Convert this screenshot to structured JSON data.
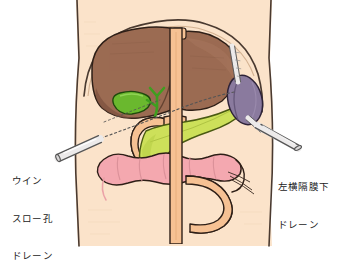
{
  "figure": {
    "background_color": "#ffffff",
    "body_fill": "#fbe3ca",
    "outline_color": "#3a2a22"
  },
  "labels": {
    "left_drain": {
      "name": "winslow-foramen-drain-label",
      "lines": [
        "ウイン",
        "スロー孔",
        "ドレーン"
      ],
      "line1": "ウイン",
      "line2": "スロー孔",
      "line3": "ドレーン",
      "color": "#1b1b1b"
    },
    "right_drain": {
      "name": "left-subphrenic-drain-label",
      "lines": [
        "左横隔膜下",
        "ドレーン"
      ],
      "line1": "左横隔膜下",
      "line2": "ドレーン",
      "color": "#1b1b1b"
    }
  },
  "organs": [
    {
      "id": "liver",
      "label": "肝臓",
      "color": "#9b6b52",
      "shade": "#7d5240"
    },
    {
      "id": "gallbladder",
      "label": "胆嚢",
      "color": "#6ab82e",
      "shade": "#4f9120"
    },
    {
      "id": "bile-duct",
      "label": "胆管",
      "color": "#3f9e1f",
      "shade": "#2f7a15"
    },
    {
      "id": "spleen",
      "label": "脾臓",
      "color": "#8a7a9e",
      "shade": "#6d5f80"
    },
    {
      "id": "pancreas",
      "label": "膵臓",
      "color": "#cde05a",
      "shade": "#aac33d"
    },
    {
      "id": "duodenum",
      "label": "十二指腸",
      "color": "#f6c193",
      "shade": "#dda36f"
    },
    {
      "id": "transverse-colon",
      "label": "横行結腸",
      "color": "#f4a8b0",
      "shade": "#e0828c"
    },
    {
      "id": "small-bowel",
      "label": "小腸",
      "color": "#f6c193",
      "shade": "#dda36f"
    },
    {
      "id": "aorta",
      "label": "大動脈",
      "color": "#f6c193",
      "shade": "#dda36f"
    }
  ],
  "drains": [
    {
      "id": "winslow-drain",
      "label": "ウインスロー孔ドレーン",
      "side": "left",
      "tube_color": "#eceaea",
      "tube_outline": "#555555",
      "dotted_color": "#555555"
    },
    {
      "id": "left-subphrenic-drain",
      "label": "左横隔膜下ドレーン",
      "side": "right",
      "tube_color": "#eceaea",
      "tube_outline": "#555555",
      "dotted_color": "#555555"
    }
  ]
}
